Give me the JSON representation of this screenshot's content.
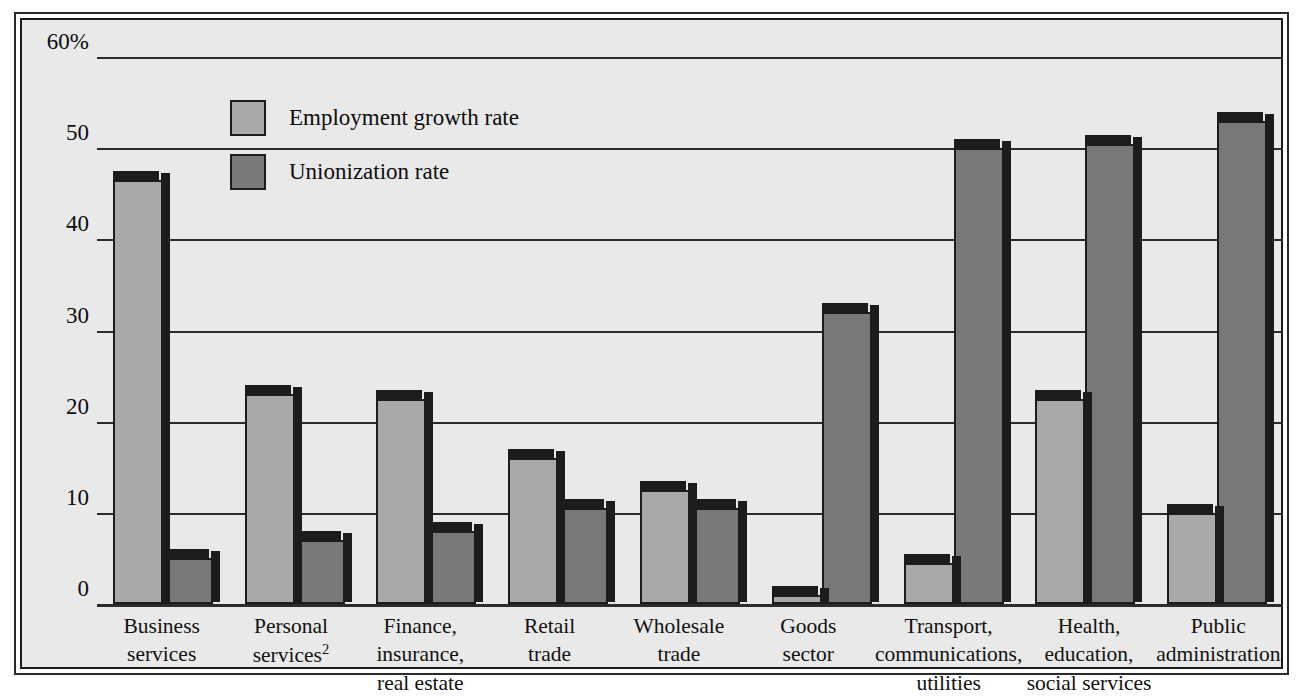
{
  "chart_data": {
    "type": "bar",
    "title": "",
    "subtitle": "",
    "xlabel": "",
    "ylabel": "",
    "ylim": [
      0,
      60
    ],
    "yticks": [
      "0",
      "10",
      "20",
      "30",
      "40",
      "50",
      "60%"
    ],
    "grid": true,
    "legend_position": "inside-top-left",
    "categories": [
      "Business services",
      "Personal services2",
      "Finance, insurance, real estate",
      "Retail trade",
      "Wholesale trade",
      "Goods sector",
      "Transport, communications, utilities",
      "Health, education, social services",
      "Public administration"
    ],
    "series": [
      {
        "name": "Employment growth rate",
        "color": "#a9a9a9",
        "values": [
          46.5,
          23.0,
          22.5,
          16.0,
          12.5,
          1.0,
          4.5,
          22.5,
          10.0
        ]
      },
      {
        "name": "Unionization rate",
        "color": "#787878",
        "values": [
          5.0,
          7.0,
          8.0,
          10.5,
          10.5,
          32.0,
          50.0,
          50.5,
          53.0
        ]
      }
    ]
  },
  "axis": {
    "yticks": [
      {
        "label": "60%",
        "value": 60
      },
      {
        "label": "50",
        "value": 50
      },
      {
        "label": "40",
        "value": 40
      },
      {
        "label": "30",
        "value": 30
      },
      {
        "label": "20",
        "value": 20
      },
      {
        "label": "10",
        "value": 10
      },
      {
        "label": "0",
        "value": 0
      }
    ]
  },
  "xlabels": [
    {
      "lines": [
        "Business",
        "services"
      ],
      "footnote": ""
    },
    {
      "lines": [
        "Personal",
        "services"
      ],
      "footnote": "2"
    },
    {
      "lines": [
        "Finance,",
        "insurance,",
        "real estate"
      ],
      "footnote": ""
    },
    {
      "lines": [
        "Retail",
        "trade"
      ],
      "footnote": ""
    },
    {
      "lines": [
        "Wholesale",
        "trade"
      ],
      "footnote": ""
    },
    {
      "lines": [
        "Goods",
        "sector"
      ],
      "footnote": ""
    },
    {
      "lines": [
        "Transport,",
        "communications,",
        "utilities"
      ],
      "footnote": ""
    },
    {
      "lines": [
        "Health,",
        "education,",
        "social services"
      ],
      "footnote": ""
    },
    {
      "lines": [
        "Public",
        "administration"
      ],
      "footnote": ""
    }
  ],
  "legend": {
    "items": [
      {
        "label": "Employment growth rate",
        "color": "#a9a9a9",
        "key": "light"
      },
      {
        "label": "Unionization rate",
        "color": "#787878",
        "key": "dark"
      }
    ]
  },
  "colors": {
    "background": "#e9e9e9",
    "frame": "#1a1a1a",
    "gridline": "#2b2b2b",
    "series_light": "#a9a9a9",
    "series_dark": "#787878",
    "bar_outline": "#1c1c1c"
  }
}
